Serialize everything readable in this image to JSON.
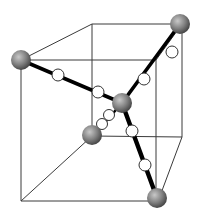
{
  "diagram": {
    "title": "",
    "colors": {
      "background": "#ffffff",
      "cube_edge": "#3a3a3a",
      "bond": "#000000",
      "large_atom_light": "#bdbdbd",
      "large_atom_dark": "#4a4a4a",
      "small_atom_fill": "#ffffff",
      "small_atom_stroke": "#333333"
    },
    "cube": {
      "vertices": {
        "front_top_left": "A",
        "front_top_right": "B",
        "front_bottom_right": "C",
        "front_bottom_left": "D",
        "back_top_left": "E",
        "back_top_right": "F",
        "back_bottom_right": "G",
        "back_bottom_left": "H"
      }
    },
    "atoms": {
      "center": {
        "type": "large",
        "label": ""
      },
      "corners": [
        {
          "id": "corner-front-top-left",
          "type": "large"
        },
        {
          "id": "corner-back-top-right",
          "type": "large"
        },
        {
          "id": "corner-back-bottom-left",
          "type": "large"
        },
        {
          "id": "corner-front-bottom-right",
          "type": "large"
        }
      ],
      "bridging_per_bond": 2
    },
    "bonds": [
      {
        "from": "center",
        "to": "corner-front-top-left",
        "bridging_atoms": 2
      },
      {
        "from": "center",
        "to": "corner-back-top-right",
        "bridging_atoms": 2
      },
      {
        "from": "center",
        "to": "corner-back-bottom-left",
        "bridging_atoms": 2
      },
      {
        "from": "center",
        "to": "corner-front-bottom-right",
        "bridging_atoms": 2
      }
    ]
  }
}
